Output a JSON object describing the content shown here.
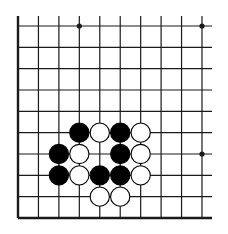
{
  "diagram": {
    "type": "go-board-fragment",
    "columns": 10,
    "rows": 10,
    "edges": {
      "left": true,
      "bottom": true,
      "top": false,
      "right": false
    },
    "colors": {
      "line": "#1a1a1a",
      "black_stone": "#000000",
      "white_stone": "#ffffff",
      "background": "#ffffff"
    },
    "star_points": [
      {
        "col": 3,
        "row": 0
      },
      {
        "col": 9,
        "row": 0
      },
      {
        "col": 9,
        "row": 6
      }
    ],
    "stones": [
      {
        "color": "black",
        "col": 3,
        "row": 5
      },
      {
        "color": "white",
        "col": 4,
        "row": 5
      },
      {
        "color": "black",
        "col": 5,
        "row": 5
      },
      {
        "color": "white",
        "col": 6,
        "row": 5
      },
      {
        "color": "black",
        "col": 2,
        "row": 6
      },
      {
        "color": "white",
        "col": 3,
        "row": 6
      },
      {
        "color": "black",
        "col": 5,
        "row": 6
      },
      {
        "color": "white",
        "col": 6,
        "row": 6
      },
      {
        "color": "black",
        "col": 2,
        "row": 7
      },
      {
        "color": "white",
        "col": 3,
        "row": 7
      },
      {
        "color": "black",
        "col": 4,
        "row": 7
      },
      {
        "color": "black",
        "col": 5,
        "row": 7
      },
      {
        "color": "white",
        "col": 6,
        "row": 7
      },
      {
        "color": "white",
        "col": 4,
        "row": 8
      },
      {
        "color": "white",
        "col": 5,
        "row": 8
      }
    ]
  }
}
